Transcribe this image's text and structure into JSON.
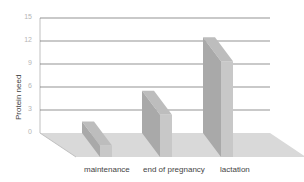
{
  "chart_data": {
    "type": "bar",
    "style": "3d",
    "title": "",
    "xlabel": "",
    "ylabel": "Protein need",
    "categories": [
      "maintenance",
      "end of pregnancy",
      "lactation"
    ],
    "values": [
      1.5,
      5.5,
      12.5
    ],
    "ylim": [
      0,
      15
    ],
    "yticks": [
      "0",
      "3",
      "6",
      "9",
      "12",
      "15"
    ],
    "grid": true,
    "legend": null,
    "colors": {
      "bar_front": "#a9a9a9",
      "bar_side": "#c8c8c8",
      "bar_top": "#bdbdbd",
      "floor": "#d9d9d9",
      "gridline": "#666666",
      "wall_line": "#c0c0c0"
    }
  }
}
